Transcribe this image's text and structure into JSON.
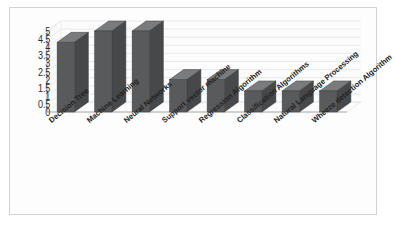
{
  "chart_data": {
    "type": "bar",
    "title": "",
    "subtitle": "",
    "xlabel": "",
    "ylabel": "",
    "ylim": [
      0,
      5
    ],
    "ytick_step": 0.5,
    "ytick_labels": [
      "0",
      "0.5",
      "1",
      "1.5",
      "2",
      "2.5",
      "3",
      "3.5",
      "4",
      "4.5",
      "5"
    ],
    "grid": true,
    "legend": false,
    "legend_position": "none",
    "three_d": true,
    "categories": [
      "Decision Tree",
      "Machine Learning",
      "Neural Networks",
      "Support vector machine",
      "Regression Algorithm",
      "Classification Algorithms",
      "Natural Language Processing",
      "Wheeze detection Algorithm"
    ],
    "values": [
      4.3,
      5.0,
      5.0,
      2.0,
      2.0,
      1.3,
      1.3,
      1.3
    ],
    "series": [
      {
        "name": "Series 1",
        "values": [
          4.3,
          5.0,
          5.0,
          2.0,
          2.0,
          1.3,
          1.3,
          1.3
        ]
      }
    ]
  },
  "style": {
    "bar_front_color": "#595a5c",
    "bar_top_color": "#7a7b7d",
    "bar_side_color": "#47484a",
    "grid_color": "#d9d9d9",
    "wall_color": "#fbfbfb",
    "frame_color": "#d2d2d2",
    "background": "#ffffff",
    "text_color": "#232323"
  }
}
